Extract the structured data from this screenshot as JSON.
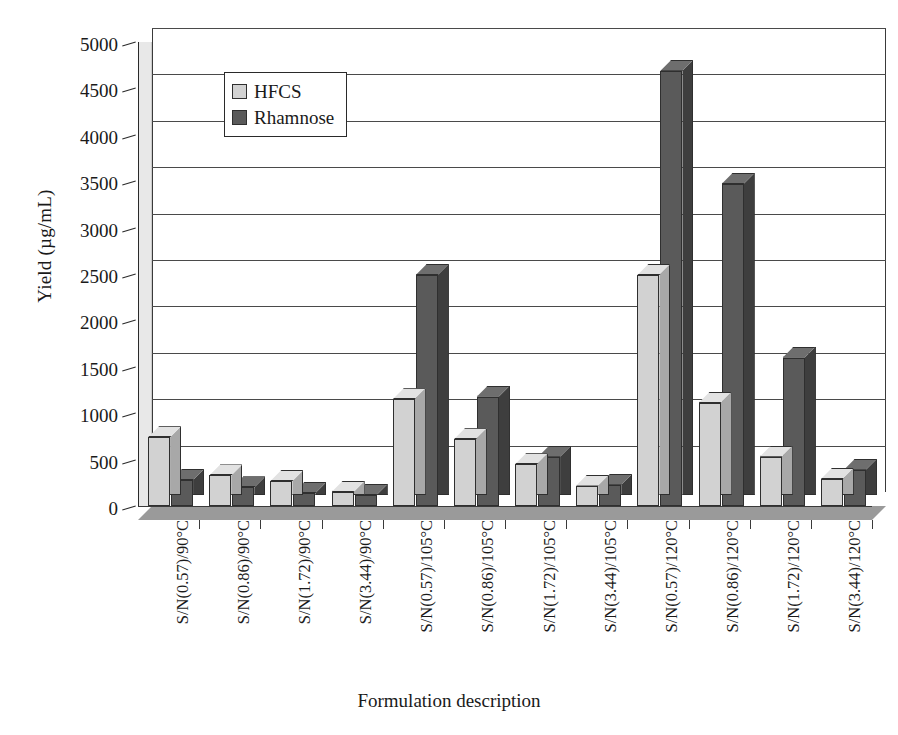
{
  "chart_data": {
    "type": "bar",
    "title": "",
    "xlabel": "Formulation description",
    "ylabel": "Yield (µg/mL)",
    "ylim": [
      0,
      5000
    ],
    "yticks": [
      0,
      500,
      1000,
      1500,
      2000,
      2500,
      3000,
      3500,
      4000,
      4500,
      5000
    ],
    "ytick_labels": [
      "0",
      "500",
      "1000",
      "1500",
      "2000",
      "2500",
      "3000",
      "3500",
      "4000",
      "4500",
      "5000"
    ],
    "grid": true,
    "legend_position": "upper-left-inside",
    "style": "3d-clustered-column",
    "categories": [
      "S/N(0.57)/90°C",
      "S/N(0.86)/90°C",
      "S/N(1.72)/90°C",
      "S/N(3.44)/90°C",
      "S/N(0.57)/105°C",
      "S/N(0.86)/105°C",
      "S/N(1.72)/105°C",
      "S/N(3.44)/105°C",
      "S/N(0.57)/120°C",
      "S/N(0.86)/120°C",
      "S/N(1.72)/120°C",
      "S/N(3.44)/120°C"
    ],
    "series": [
      {
        "name": "HFCS",
        "color": "#d2d2d2",
        "values": [
          740,
          330,
          270,
          150,
          1150,
          720,
          450,
          220,
          2490,
          1110,
          530,
          290
        ]
      },
      {
        "name": "Rhamnose",
        "color": "#5a5a5a",
        "values": [
          280,
          200,
          140,
          120,
          2490,
          1180,
          530,
          230,
          4690,
          3470,
          1600,
          390
        ]
      }
    ]
  },
  "legend": {
    "items": [
      {
        "label": "HFCS",
        "swatch": "light-gray-swatch"
      },
      {
        "label": "Rhamnose",
        "swatch": "dark-gray-swatch"
      }
    ]
  }
}
